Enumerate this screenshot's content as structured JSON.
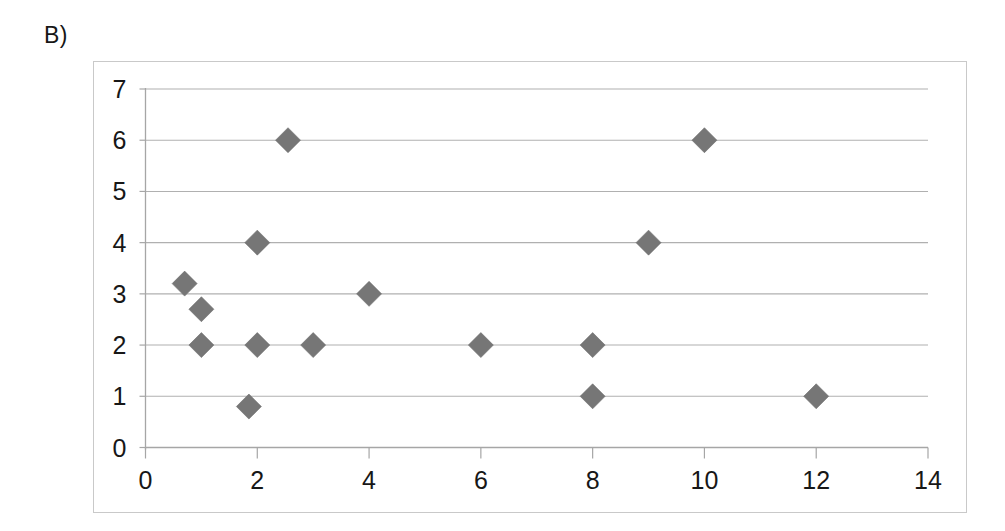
{
  "panel": {
    "label": "B)"
  },
  "colors": {
    "marker": "#767676",
    "gridline": "#b0b0b0",
    "axis": "#a6a6a6",
    "frame_border": "#c9c9c9",
    "text": "#171717",
    "background": "#ffffff"
  },
  "chart_data": {
    "type": "scatter",
    "title": "",
    "xlabel": "",
    "ylabel": "",
    "xlim": [
      0,
      14
    ],
    "ylim": [
      0,
      7
    ],
    "xticks": [
      0,
      2,
      4,
      6,
      8,
      10,
      12,
      14
    ],
    "yticks": [
      0,
      1,
      2,
      3,
      4,
      5,
      6,
      7
    ],
    "xtick_labels": [
      "0",
      "2",
      "4",
      "6",
      "8",
      "10",
      "12",
      "14"
    ],
    "ytick_labels": [
      "0",
      "1",
      "2",
      "3",
      "4",
      "5",
      "6",
      "7"
    ],
    "grid": "horizontal",
    "legend": "none",
    "marker_shape": "diamond",
    "series": [
      {
        "name": "series-1",
        "points": [
          {
            "x": 0.7,
            "y": 3.2
          },
          {
            "x": 1.0,
            "y": 2.7
          },
          {
            "x": 1.0,
            "y": 2.0
          },
          {
            "x": 1.85,
            "y": 0.8
          },
          {
            "x": 2.0,
            "y": 4.0
          },
          {
            "x": 2.0,
            "y": 2.0
          },
          {
            "x": 2.55,
            "y": 6.0
          },
          {
            "x": 3.0,
            "y": 2.0
          },
          {
            "x": 4.0,
            "y": 3.0
          },
          {
            "x": 6.0,
            "y": 2.0
          },
          {
            "x": 8.0,
            "y": 2.0
          },
          {
            "x": 8.0,
            "y": 1.0
          },
          {
            "x": 9.0,
            "y": 4.0
          },
          {
            "x": 10.0,
            "y": 6.0
          },
          {
            "x": 12.0,
            "y": 1.0
          }
        ]
      }
    ]
  }
}
